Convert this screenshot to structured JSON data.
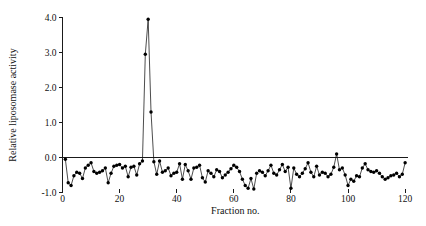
{
  "figure": {
    "background_color": "#ffffff",
    "foreground_color": "#111111"
  },
  "chart_data": {
    "type": "line",
    "title": "",
    "subtitle": "",
    "xlabel": "Fraction no.",
    "ylabel": "Relative liposomase activity",
    "xlim": [
      0,
      121
    ],
    "ylim": [
      -1.0,
      4.0
    ],
    "xticks": [
      0,
      20,
      40,
      60,
      80,
      100,
      120
    ],
    "xtick_labels": [
      "0",
      "20",
      "40",
      "60",
      "80",
      "100",
      "120"
    ],
    "yticks": [
      -1.0,
      0.0,
      1.0,
      2.0,
      3.0,
      4.0
    ],
    "ytick_labels": [
      "-1.0",
      "0.0",
      "1.0",
      "2.0",
      "3.0",
      "4.0"
    ],
    "grid": false,
    "legend": null,
    "legend_position": "none",
    "marker": "filled-circle",
    "line_color": "#111111",
    "marker_color": "#000000",
    "annotations": [],
    "series": [
      {
        "name": "Relative liposomase activity",
        "x": [
          1,
          2,
          3,
          4,
          5,
          6,
          7,
          8,
          9,
          10,
          11,
          12,
          13,
          14,
          15,
          16,
          17,
          18,
          19,
          20,
          21,
          22,
          23,
          24,
          25,
          26,
          27,
          28,
          29,
          30,
          31,
          32,
          33,
          34,
          35,
          36,
          37,
          38,
          39,
          40,
          41,
          42,
          43,
          44,
          45,
          46,
          47,
          48,
          49,
          50,
          51,
          52,
          53,
          54,
          55,
          56,
          57,
          58,
          59,
          60,
          61,
          62,
          63,
          64,
          65,
          66,
          67,
          68,
          69,
          70,
          71,
          72,
          73,
          74,
          75,
          76,
          77,
          78,
          79,
          80,
          81,
          82,
          83,
          84,
          85,
          86,
          87,
          88,
          89,
          90,
          91,
          92,
          93,
          94,
          95,
          96,
          97,
          98,
          99,
          100,
          101,
          102,
          103,
          104,
          105,
          106,
          107,
          108,
          109,
          110,
          111,
          112,
          113,
          114,
          115,
          116,
          117,
          118,
          119,
          120
        ],
        "y": [
          -0.05,
          -0.72,
          -0.8,
          -0.52,
          -0.42,
          -0.45,
          -0.6,
          -0.3,
          -0.22,
          -0.15,
          -0.4,
          -0.45,
          -0.42,
          -0.38,
          -0.3,
          -0.72,
          -0.45,
          -0.25,
          -0.22,
          -0.2,
          -0.3,
          -0.25,
          -0.55,
          -0.28,
          -0.25,
          -0.5,
          -0.18,
          -0.1,
          2.95,
          3.95,
          1.3,
          -0.12,
          -0.48,
          -0.1,
          -0.42,
          -0.38,
          -0.3,
          -0.52,
          -0.45,
          -0.42,
          -0.18,
          -0.62,
          -0.2,
          -0.38,
          -0.62,
          -0.3,
          -0.28,
          -0.22,
          -0.58,
          -0.7,
          -0.38,
          -0.45,
          -0.55,
          -0.35,
          -0.4,
          -0.58,
          -0.5,
          -0.42,
          -0.32,
          -0.22,
          -0.28,
          -0.4,
          -0.62,
          -0.8,
          -0.88,
          -0.6,
          -0.9,
          -0.45,
          -0.38,
          -0.42,
          -0.52,
          -0.38,
          -0.22,
          -0.45,
          -0.5,
          -0.35,
          -0.2,
          -0.4,
          -0.28,
          -0.88,
          -0.3,
          -0.48,
          -0.55,
          -0.45,
          -0.32,
          -0.15,
          -0.42,
          -0.55,
          -0.25,
          -0.5,
          -0.42,
          -0.45,
          -0.55,
          -0.48,
          -0.28,
          0.1,
          -0.35,
          -0.3,
          -0.5,
          -0.8,
          -0.62,
          -0.68,
          -0.52,
          -0.55,
          -0.3,
          -0.18,
          -0.35,
          -0.4,
          -0.42,
          -0.38,
          -0.45,
          -0.55,
          -0.62,
          -0.58,
          -0.52,
          -0.5,
          -0.45,
          -0.55,
          -0.48,
          -0.15
        ]
      }
    ]
  }
}
